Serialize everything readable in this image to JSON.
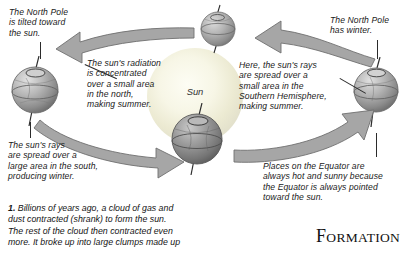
{
  "figure": {
    "sun": {
      "label": "Sun",
      "color": "#f4f2dd"
    },
    "arrow_color": "#9b9b9b",
    "globe_color": "#8e8e8e"
  },
  "callouts": {
    "north_pole_tilted": "The North Pole\nis tilted toward\nthe sun.",
    "radiation_concentrated": "The sun's radiation\nis concentrated\nover a small area\nin the north,\nmaking summer.",
    "rays_spread_south": "The sun's rays\nare spread over a\nlarge area in the south,\nproducing winter.",
    "north_pole_winter": "The North Pole\nhas winter.",
    "rays_southern_hemisphere": "Here, the sun's rays\nare spread over a\nsmall area in the\nSouthern Hemisphere,\nmaking summer.",
    "equator_hot": "Places on the Equator are\nalways hot and sunny because\nthe Equator is always pointed\ntoward the sun."
  },
  "body": {
    "step_number": "1.",
    "paragraph": " Billions of years ago, a cloud of gas and\ndust contracted (shrank) to form the sun.\nThe rest of the cloud then contracted even\nmore. It broke up into large clumps made up"
  },
  "section_heading": {
    "first_letter": "F",
    "rest": "ORMATION"
  }
}
